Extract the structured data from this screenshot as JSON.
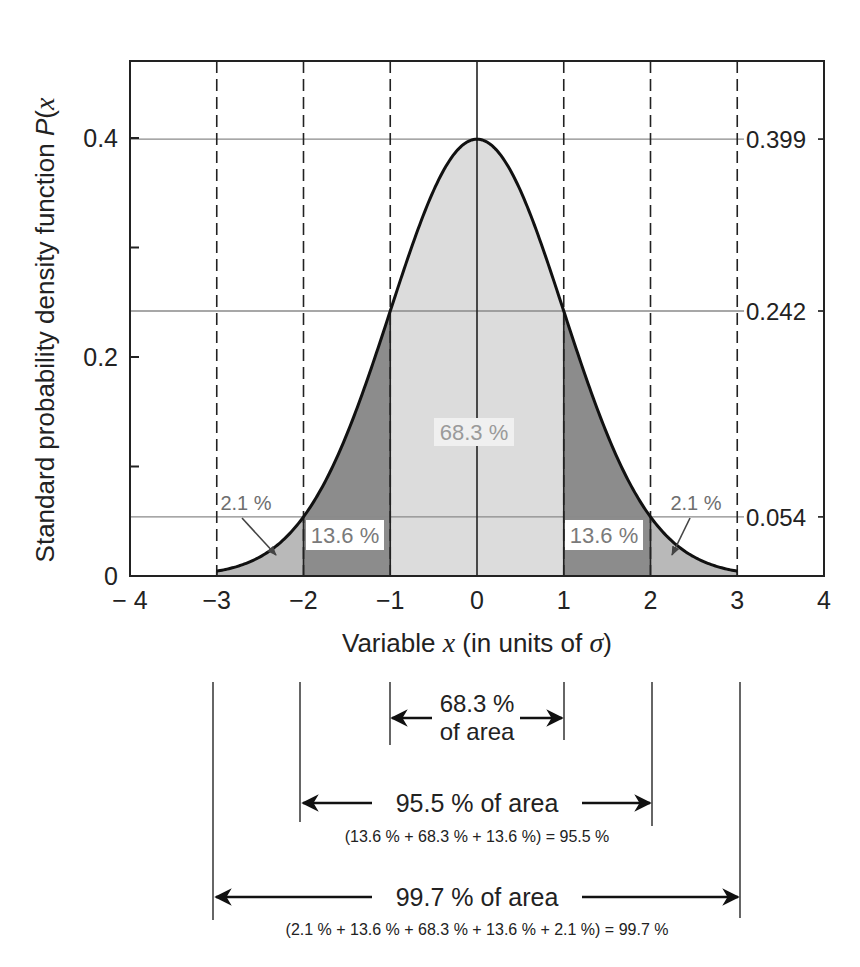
{
  "chart_data": {
    "type": "area",
    "title": "",
    "xlabel": "Variable x (in units of σ)",
    "xlabel_parts": {
      "prefix": "Variable ",
      "var": "x",
      "mid": " (in units of ",
      "sigma": "σ",
      "suffix": ")"
    },
    "ylabel": "Standard probability density function P(x)",
    "ylabel_parts": {
      "prefix": "Standard probability density function ",
      "var": "P",
      "open": "(",
      "x": "x"
    },
    "xlim": [
      -4,
      4
    ],
    "ylim": [
      0,
      0.47
    ],
    "x_ticks": [
      "− 4",
      "−3",
      "−2",
      "−1",
      "0",
      "1",
      "2",
      "3",
      "4"
    ],
    "x_tick_values": [
      -4,
      -3,
      -2,
      -1,
      0,
      1,
      2,
      3,
      4
    ],
    "y_ticks_left": [
      "0",
      "0.2",
      "0.4"
    ],
    "y_tick_values_left": [
      0,
      0.2,
      0.4
    ],
    "y_minor_ticks_left": [
      0.1,
      0.3
    ],
    "y_ticks_right": [
      "0.399",
      "0.242",
      "0.054"
    ],
    "y_tick_values_right": [
      0.399,
      0.242,
      0.054
    ],
    "curve": "standard normal N(0,1)",
    "x": [
      -3,
      -2.5,
      -2,
      -1.5,
      -1,
      -0.5,
      0,
      0.5,
      1,
      1.5,
      2,
      2.5,
      3
    ],
    "values": [
      0.0044,
      0.0175,
      0.054,
      0.1295,
      0.242,
      0.3521,
      0.399,
      0.3521,
      0.242,
      0.1295,
      0.054,
      0.0175,
      0.0044
    ],
    "dashed_verticals": [
      -3,
      -2,
      -1,
      1,
      2,
      3
    ],
    "solid_verticals": [
      0
    ],
    "regions": [
      {
        "from": -3,
        "to": -2,
        "label": "2.1 %",
        "shade": "#b9b9b9"
      },
      {
        "from": -2,
        "to": -1,
        "label": "13.6 %",
        "shade": "#8c8c8c"
      },
      {
        "from": -1,
        "to": 1,
        "label": "68.3 %",
        "shade": "#dcdcdc"
      },
      {
        "from": 1,
        "to": 2,
        "label": "13.6 %",
        "shade": "#8c8c8c"
      },
      {
        "from": 2,
        "to": 3,
        "label": "2.1 %",
        "shade": "#b9b9b9"
      }
    ],
    "grid": false
  },
  "annotations": {
    "span_1sigma": {
      "line1": "68.3 %",
      "line2": "of area"
    },
    "span_2sigma": {
      "label": "95.5 % of area",
      "formula": "(13.6 % + 68.3 % + 13.6 %) = 95.5 %"
    },
    "span_3sigma": {
      "label": "99.7 % of area",
      "formula": "(2.1 % + 13.6 % + 68.3 % + 13.6 % + 2.1 %) = 99.7 %"
    }
  },
  "colors": {
    "curve": "#111111",
    "frame": "#222222",
    "guide": "#8a8a8a",
    "center_fill": "#dcdcdc",
    "mid_fill": "#8c8c8c",
    "tail_fill": "#b9b9b9",
    "label_grey": "#7a7a7a"
  }
}
